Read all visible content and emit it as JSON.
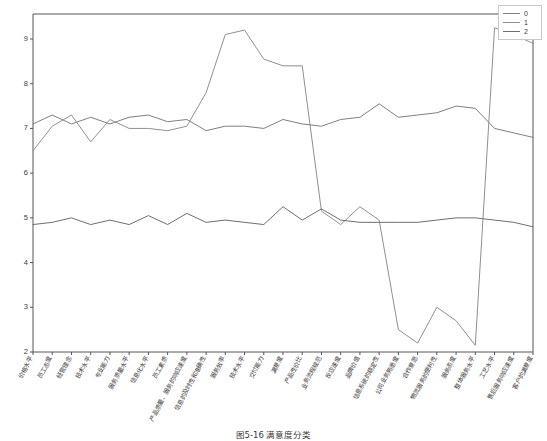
{
  "caption": "图5-16  满意度分类",
  "legend": {
    "position": "top-right",
    "entries": [
      {
        "label": "0",
        "color": "#808080"
      },
      {
        "label": "1",
        "color": "#909090"
      },
      {
        "label": "2",
        "color": "#6e6e6e"
      }
    ]
  },
  "chart_data": {
    "type": "line",
    "title": "",
    "xlabel": "",
    "ylabel": "",
    "ylim": [
      2,
      9.4
    ],
    "yticks": [
      2,
      3,
      4,
      5,
      6,
      7,
      8,
      9
    ],
    "ytick_labels": [
      "2",
      "3",
      "4",
      "5",
      "6",
      "7",
      "8",
      "9"
    ],
    "grid": false,
    "legend_position": "upper right",
    "categories": [
      "价格水平",
      "员工态度",
      "经营理念",
      "技术水平",
      "专业能力",
      "服务质量水平",
      "信息化水平",
      "员工素质",
      "产品质量、服务的响应速度",
      "信息的及时性和准确性",
      "服务效率",
      "技术水平",
      "交付能力",
      "满意度",
      "产品性价比",
      "业务流程规范",
      "反应速度",
      "品牌价值",
      "信息系统的稳定性",
      "公司业务熟悉度",
      "合作意愿",
      "物流服务的便利性",
      "服务态度",
      "整体服务水平",
      "工艺水平",
      "售后服务响应速度",
      "客户的满意度"
    ],
    "series": [
      {
        "name": "0",
        "color": "#808080",
        "values": [
          7.1,
          7.3,
          7.1,
          7.25,
          7.1,
          7.25,
          7.3,
          7.15,
          7.2,
          6.95,
          7.05,
          7.05,
          7.0,
          7.2,
          7.1,
          7.05,
          7.2,
          7.25,
          7.55,
          7.25,
          7.3,
          7.35,
          7.5,
          7.45,
          7.0,
          6.9,
          6.8
        ]
      },
      {
        "name": "1",
        "color": "#909090",
        "values": [
          6.5,
          7.05,
          7.3,
          6.7,
          7.2,
          7.0,
          7.0,
          6.95,
          7.05,
          7.8,
          9.1,
          9.2,
          8.55,
          8.4,
          8.4,
          5.15,
          4.85,
          5.25,
          4.95,
          2.5,
          2.2,
          3.0,
          2.7,
          2.15,
          9.25,
          9.1,
          8.9
        ]
      },
      {
        "name": "2",
        "color": "#6e6e6e",
        "values": [
          4.85,
          4.9,
          5.0,
          4.85,
          4.95,
          4.85,
          5.05,
          4.85,
          5.1,
          4.9,
          4.95,
          4.9,
          4.85,
          5.25,
          4.95,
          5.2,
          4.95,
          4.9,
          4.9,
          4.9,
          4.9,
          4.95,
          5.0,
          5.0,
          4.95,
          4.9,
          4.8
        ]
      }
    ]
  },
  "axes": {
    "x_domain_px": [
      33,
      533
    ],
    "y_domain_px": [
      352,
      39
    ]
  }
}
